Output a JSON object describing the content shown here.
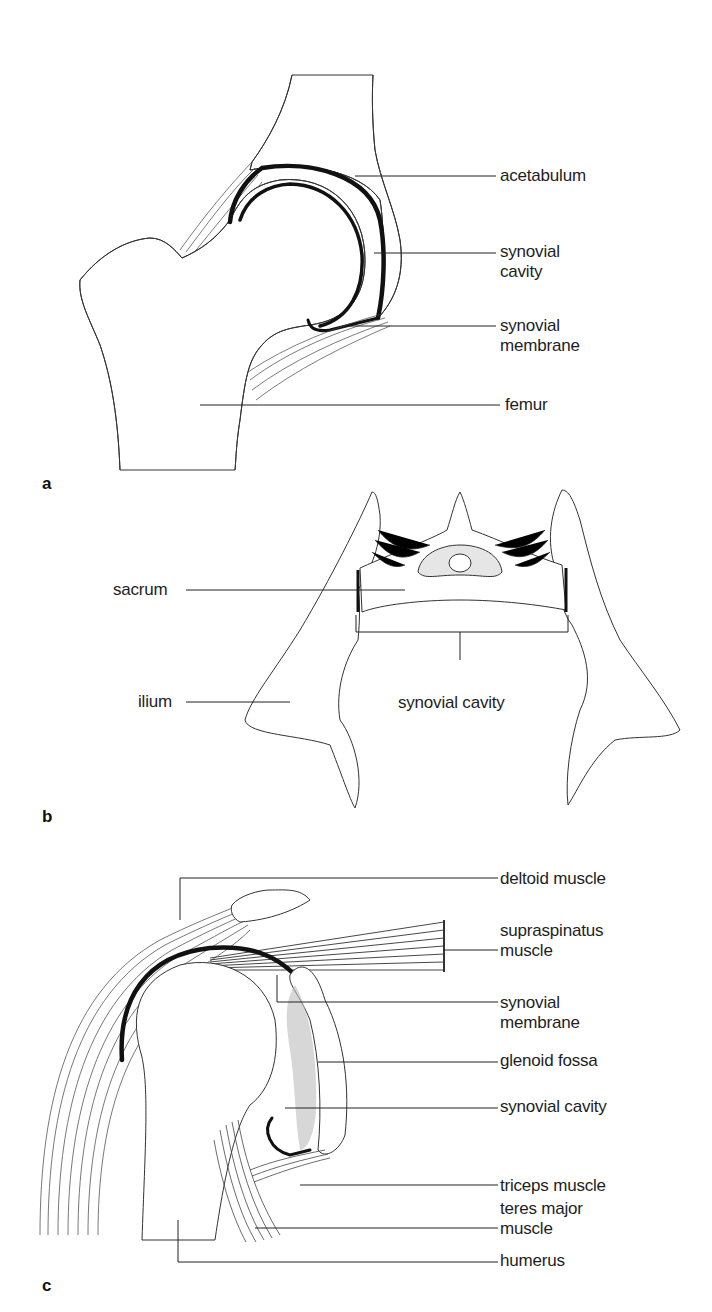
{
  "figure": {
    "panels": [
      {
        "id": "a",
        "letter": "a",
        "subject": "hip joint",
        "labels": [
          {
            "text": "acetabulum"
          },
          {
            "text": "synovial\ncavity"
          },
          {
            "text": "synovial\nmembrane"
          },
          {
            "text": "femur"
          }
        ]
      },
      {
        "id": "b",
        "letter": "b",
        "subject": "sacroiliac joint",
        "labels": [
          {
            "text": "sacrum"
          },
          {
            "text": "ilium"
          },
          {
            "text": "synovial cavity"
          }
        ]
      },
      {
        "id": "c",
        "letter": "c",
        "subject": "shoulder joint",
        "labels": [
          {
            "text": "deltoid muscle"
          },
          {
            "text": "supraspinatus\nmuscle"
          },
          {
            "text": "synovial\nmembrane"
          },
          {
            "text": "glenoid fossa"
          },
          {
            "text": "synovial cavity"
          },
          {
            "text": "triceps muscle"
          },
          {
            "text": "teres major\nmuscle"
          },
          {
            "text": "humerus"
          }
        ]
      }
    ]
  },
  "colors": {
    "background": "#ffffff",
    "ink": "#1e1e1e",
    "bone_fill": "#ffffff",
    "cartilage": "#111111",
    "trabecular_dots": "#555555"
  }
}
